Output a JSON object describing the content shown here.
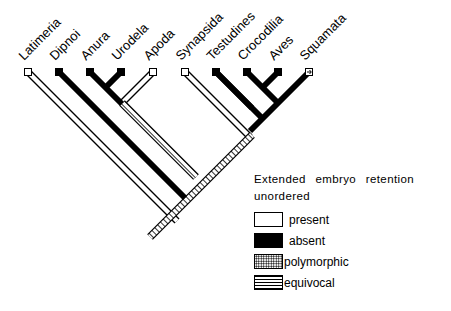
{
  "figure": {
    "type": "cladogram",
    "character": "Extended embryo retention",
    "taxa": [
      {
        "name": "Latimeria",
        "state": "present"
      },
      {
        "name": "Dipnoi",
        "state": "absent"
      },
      {
        "name": "Anura",
        "state": "absent"
      },
      {
        "name": "Urodela",
        "state": "absent"
      },
      {
        "name": "Apoda",
        "state": "present"
      },
      {
        "name": "Synapsida",
        "state": "present"
      },
      {
        "name": "Testudines",
        "state": "absent"
      },
      {
        "name": "Crocodilia",
        "state": "absent"
      },
      {
        "name": "Aves",
        "state": "absent"
      },
      {
        "name": "Squamata",
        "state": "polymorphic"
      }
    ],
    "colors": {
      "line": "#000000",
      "background": "#ffffff"
    }
  },
  "legend": {
    "title_line1": "Extended embryo retention",
    "title_line2": "unordered",
    "items": [
      {
        "key": "present",
        "label": "present"
      },
      {
        "key": "absent",
        "label": "absent"
      },
      {
        "key": "polymorphic",
        "label": "polymorphic"
      },
      {
        "key": "equivocal",
        "label": "equivocal"
      }
    ]
  }
}
